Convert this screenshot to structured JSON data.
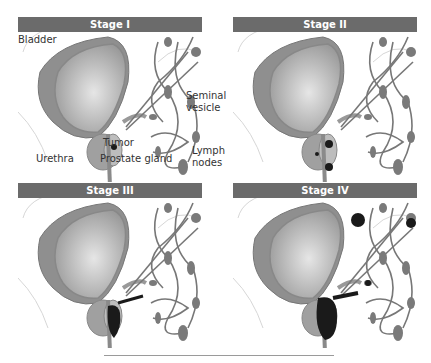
{
  "figure": {
    "panels": [
      {
        "title": "Stage I"
      },
      {
        "title": "Stage II"
      },
      {
        "title": "Stage III"
      },
      {
        "title": "Stage IV"
      }
    ],
    "labels": {
      "bladder": "Bladder",
      "seminal_1": "Seminal",
      "seminal_2": "vesicle",
      "tumor": "Tumor",
      "urethra": "Urethra",
      "prostate": "Prostate gland",
      "lymph_1": "Lymph",
      "lymph_2": "nodes"
    },
    "colors": {
      "header": "#6b6b6b",
      "organ": "#a8a8a8",
      "vessel": "#777777",
      "tumor": "#1a1a1a"
    }
  }
}
